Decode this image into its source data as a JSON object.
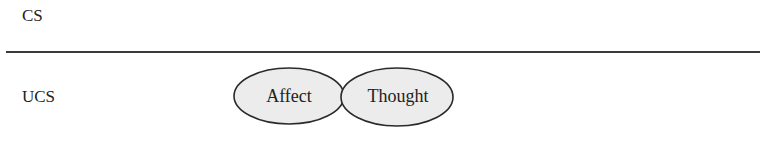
{
  "diagram": {
    "levels": [
      {
        "id": "cs",
        "label": "CS"
      },
      {
        "id": "ucs",
        "label": "UCS"
      }
    ],
    "nodes": [
      {
        "id": "affect",
        "label": "Affect",
        "level": "ucs"
      },
      {
        "id": "thought",
        "label": "Thought",
        "level": "ucs"
      }
    ],
    "colors": {
      "ellipse_fill": "#ececec",
      "ellipse_stroke": "#2a2a2a",
      "divider": "#3a3a3a",
      "text": "#222222"
    }
  }
}
